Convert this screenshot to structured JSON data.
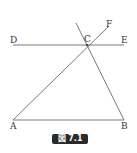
{
  "figure": {
    "caption": "図 7.1",
    "points": {
      "A": {
        "label": "A",
        "x": 13,
        "y": 120
      },
      "B": {
        "label": "B",
        "x": 124,
        "y": 120
      },
      "C": {
        "label": "C",
        "x": 87,
        "y": 45
      },
      "D": {
        "label": "D",
        "x": 13,
        "y": 45
      },
      "E": {
        "label": "E",
        "x": 124,
        "y": 45
      },
      "F": {
        "label": "F",
        "x": 108,
        "y": 26
      }
    },
    "segments": [
      {
        "name": "DE",
        "x1": 13,
        "y1": 45,
        "x2": 124,
        "y2": 45
      },
      {
        "name": "AB",
        "x1": 13,
        "y1": 120,
        "x2": 124,
        "y2": 120
      },
      {
        "name": "AF",
        "x1": 13,
        "y1": 120,
        "x2": 108,
        "y2": 27
      },
      {
        "name": "CB-extended",
        "x1": 76,
        "y1": 23,
        "x2": 124,
        "y2": 120
      }
    ],
    "line_color": "#555555"
  }
}
